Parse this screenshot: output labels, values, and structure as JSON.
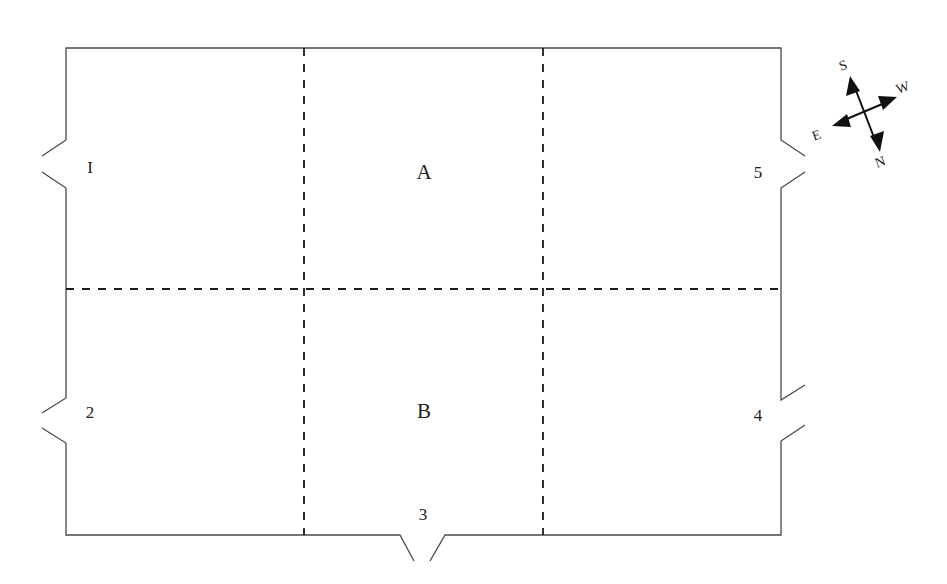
{
  "diagram": {
    "type": "floor-plan",
    "zones": [
      {
        "id": "A",
        "label": "A"
      },
      {
        "id": "B",
        "label": "B"
      }
    ],
    "doors": [
      {
        "id": "1",
        "label": "I",
        "wall": "left-upper"
      },
      {
        "id": "2",
        "label": "2",
        "wall": "left-lower"
      },
      {
        "id": "3",
        "label": "3",
        "wall": "bottom"
      },
      {
        "id": "4",
        "label": "4",
        "wall": "right-lower"
      },
      {
        "id": "5",
        "label": "5",
        "wall": "right-upper"
      }
    ],
    "grid": {
      "columns": 3,
      "rows": 2,
      "divider_style": "dashed"
    },
    "compass": {
      "labels": {
        "north": "N",
        "south": "S",
        "east": "E",
        "west": "W"
      }
    },
    "colors": {
      "wall": "#4a4a4a",
      "divider": "#1a1a1a",
      "text": "#222222"
    }
  }
}
